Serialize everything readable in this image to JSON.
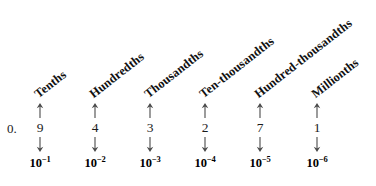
{
  "figure": {
    "leading": "0.",
    "geometry": {
      "width": 376,
      "height": 186,
      "label_angle_deg": -38,
      "arrow_up_top": 103,
      "arrow_up_height": 15,
      "digit_top": 121,
      "arrow_down_top": 137,
      "arrow_down_height": 15,
      "power_top": 155,
      "lead_left": 7,
      "lead_top": 122
    },
    "ink_color": "#111111",
    "arrow_color": "#4a4a4a",
    "background": "#ffffff"
  },
  "columns": [
    {
      "place_name": "Tenths",
      "digit": "9",
      "power_base": "10",
      "power_exponent": "−1",
      "center_x": 40,
      "label_bottom": 100
    },
    {
      "place_name": "Hundredths",
      "digit": "4",
      "power_base": "10",
      "power_exponent": "−2",
      "center_x": 95,
      "label_bottom": 100
    },
    {
      "place_name": "Thousandths",
      "digit": "3",
      "power_base": "10",
      "power_exponent": "−3",
      "center_x": 150,
      "label_bottom": 100
    },
    {
      "place_name": "Ten-thousandths",
      "digit": "2",
      "power_base": "10",
      "power_exponent": "−4",
      "center_x": 205,
      "label_bottom": 100
    },
    {
      "place_name": "Hundred-thousandths",
      "digit": "7",
      "power_base": "10",
      "power_exponent": "−5",
      "center_x": 260,
      "label_bottom": 100
    },
    {
      "place_name": "Millionths",
      "digit": "1",
      "power_base": "10",
      "power_exponent": "−6",
      "center_x": 317,
      "label_bottom": 100
    }
  ],
  "chart_data": {
    "type": "table",
    "categories": [
      "Tenths",
      "Hundredths",
      "Thousandths",
      "Ten-thousandths",
      "Hundred-thousandths",
      "Millionths"
    ],
    "values": [
      9,
      4,
      3,
      2,
      7,
      1
    ],
    "powers": [
      "10^-1",
      "10^-2",
      "10^-3",
      "10^-4",
      "10^-5",
      "10^-6"
    ],
    "number": "0.943271",
    "xlabel": "",
    "ylabel": "",
    "grid": false,
    "legend": "none"
  }
}
